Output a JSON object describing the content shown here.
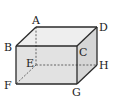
{
  "diagram": {
    "type": "cuboid",
    "colors": {
      "front_face": "#e2e2e2",
      "top_face": "#eeeeee",
      "right_face": "#d6d6d6",
      "edge": "#2a2a2a",
      "hidden_edge": "#555555"
    },
    "vertices": {
      "A": {
        "label": "A",
        "x": 36,
        "y": 27
      },
      "B": {
        "label": "B",
        "x": 16,
        "y": 46
      },
      "C": {
        "label": "C",
        "x": 77,
        "y": 46
      },
      "D": {
        "label": "D",
        "x": 97,
        "y": 27
      },
      "E": {
        "label": "E",
        "x": 36,
        "y": 65
      },
      "F": {
        "label": "F",
        "x": 16,
        "y": 84
      },
      "G": {
        "label": "G",
        "x": 77,
        "y": 84
      },
      "H": {
        "label": "H",
        "x": 97,
        "y": 65
      }
    },
    "visible_edges": [
      "AB",
      "AD",
      "BC",
      "CD",
      "BF",
      "CG",
      "FG",
      "DH",
      "GH"
    ],
    "hidden_edges": [
      "AE",
      "EF",
      "EH"
    ]
  }
}
